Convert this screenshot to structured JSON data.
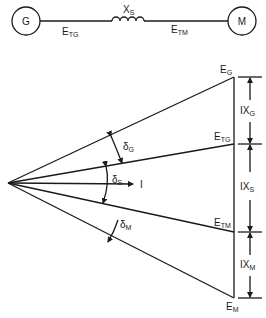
{
  "circuit": {
    "generator_label": "G",
    "motor_label": "M",
    "reactance": {
      "main": "X",
      "sub": "S"
    },
    "terminal_gen": {
      "main": "E",
      "sub": "TG"
    },
    "terminal_motor": {
      "main": "E",
      "sub": "TM"
    }
  },
  "phasor": {
    "E_G": {
      "main": "E",
      "sub": "G"
    },
    "E_TG": {
      "main": "E",
      "sub": "TG"
    },
    "E_TM": {
      "main": "E",
      "sub": "TM"
    },
    "E_M": {
      "main": "E",
      "sub": "M"
    },
    "current": "I",
    "delta_G": {
      "main": "δ",
      "sub": "G"
    },
    "delta_S": {
      "main": "δ",
      "sub": "S"
    },
    "delta_M": {
      "main": "δ",
      "sub": "M"
    },
    "drop_G": {
      "main": "IX",
      "sub": "G"
    },
    "drop_S": {
      "main": "IX",
      "sub": "S"
    },
    "drop_M": {
      "main": "IX",
      "sub": "M"
    }
  }
}
